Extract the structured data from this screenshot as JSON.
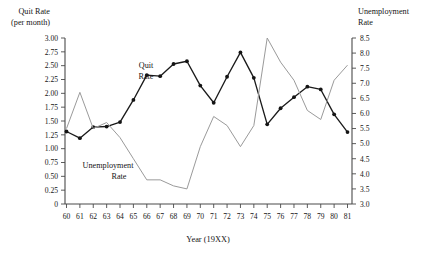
{
  "chart_data": {
    "type": "line",
    "title": "",
    "xlabel": "Year (19XX)",
    "x": [
      60,
      61,
      62,
      63,
      64,
      65,
      66,
      67,
      68,
      69,
      70,
      71,
      72,
      73,
      74,
      75,
      76,
      77,
      78,
      79,
      80,
      81
    ],
    "xtick_labels": [
      "60",
      "61",
      "62",
      "63",
      "64",
      "65",
      "66",
      "67",
      "68",
      "69",
      "70",
      "71",
      "72",
      "73",
      "74",
      "75",
      "76",
      "77",
      "78",
      "79",
      "80",
      "81"
    ],
    "grid": false,
    "legend_position": "inline-annotations",
    "left_axis": {
      "label_line1": "Quit Rate",
      "label_line2": "(per month)",
      "ylim": [
        0,
        3.0
      ],
      "tick_step": 0.25,
      "tick_labels": [
        "3.00",
        "2.75",
        "2.50",
        "2.25",
        "2.00",
        "1.75",
        "1.50",
        "1.25",
        "1.00",
        "0.75",
        "0.50",
        "0.25",
        "0"
      ],
      "tick_values": [
        3.0,
        2.75,
        2.5,
        2.25,
        2.0,
        1.75,
        1.5,
        1.25,
        1.0,
        0.75,
        0.5,
        0.25,
        0
      ]
    },
    "right_axis": {
      "label_line1": "Unemployment",
      "label_line2": "Rate",
      "ylim": [
        3.0,
        8.5
      ],
      "tick_step": 0.5,
      "tick_labels": [
        "8.5",
        "8.0",
        "7.5",
        "7.0",
        "6.5",
        "6.0",
        "5.5",
        "5.0",
        "4.5",
        "4.0",
        "3.5",
        "3.0"
      ],
      "tick_values": [
        8.5,
        8.0,
        7.5,
        7.0,
        6.5,
        6.0,
        5.5,
        5.0,
        4.5,
        4.0,
        3.5,
        3.0
      ]
    },
    "series": [
      {
        "name": "Quit Rate",
        "axis": "left",
        "color": "#141414",
        "has_markers": true,
        "annotation_label_line1": "Quit",
        "annotation_label_line2": "Rate",
        "values": [
          1.31,
          1.19,
          1.39,
          1.4,
          1.48,
          1.88,
          2.33,
          2.31,
          2.53,
          2.58,
          2.14,
          1.83,
          2.3,
          2.74,
          2.28,
          1.44,
          1.73,
          1.93,
          2.12,
          2.07,
          1.62,
          1.3
        ]
      },
      {
        "name": "Unemployment Rate",
        "axis": "right",
        "color": "#9a9a9a",
        "has_markers": false,
        "annotation_label_line1": "Unemployment",
        "annotation_label_line2": "Rate",
        "values": [
          5.5,
          6.7,
          5.5,
          5.7,
          5.2,
          4.5,
          3.8,
          3.8,
          3.6,
          3.5,
          4.9,
          5.9,
          5.6,
          4.9,
          5.6,
          8.5,
          7.7,
          7.1,
          6.1,
          5.8,
          7.1,
          7.6
        ]
      }
    ]
  }
}
